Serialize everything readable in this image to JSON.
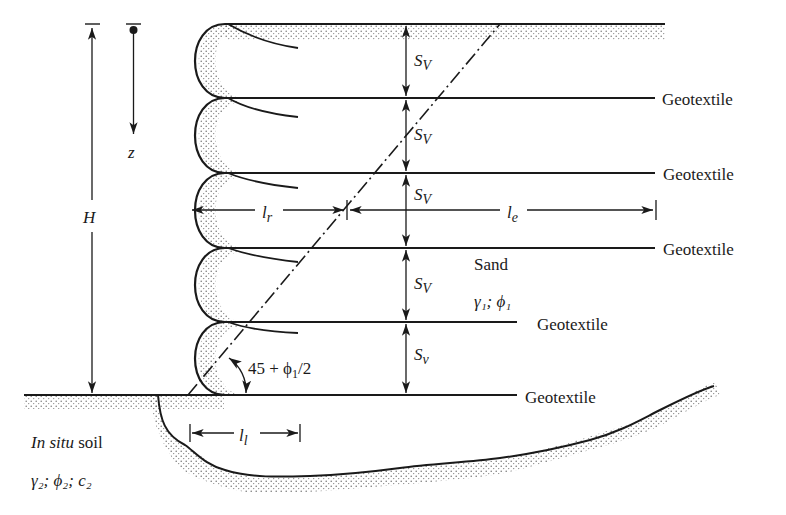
{
  "diagram": {
    "type": "geotextile-reinforced retaining wall cross-section",
    "colors": {
      "ink": "#1a1a1a",
      "stipple": "#555555",
      "background": "#ffffff"
    },
    "labels": {
      "height": "H",
      "depth": "z",
      "spacing_1": "S",
      "spacing_1_sub": "V",
      "spacing_2": "S",
      "spacing_2_sub": "V",
      "spacing_3": "S",
      "spacing_3_sub": "V",
      "spacing_4": "S",
      "spacing_4_sub": "V",
      "spacing_5": "S",
      "spacing_5_sub": "v",
      "length_r": "l",
      "length_r_sub": "r",
      "length_e": "l",
      "length_e_sub": "e",
      "length_l": "l",
      "length_l_sub": "l",
      "angle": "45 + ϕ",
      "angle_sub": "1",
      "angle_tail": "/2",
      "backfill_name": "Sand",
      "backfill_props": "γ₁; ϕ₁",
      "foundation_name_italic": "In situ",
      "foundation_name_rest": " soil",
      "foundation_props": "γ₂; ϕ₂; c₂"
    },
    "geotextile_labels": [
      "Geotextile",
      "Geotextile",
      "Geotextile",
      "Geotextile",
      "Geotextile"
    ]
  }
}
